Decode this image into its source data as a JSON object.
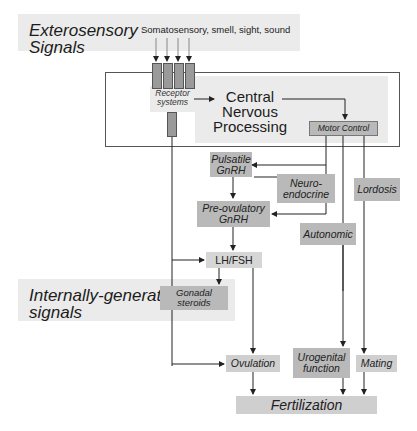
{
  "exterosensory": {
    "title_line1": "Exterosensory",
    "title_line2": "Signals",
    "inputs_label": "Somatosensory, smell, sight, sound"
  },
  "cns": {
    "receptor_line1": "Receptor",
    "receptor_line2": "systems",
    "processing_line1": "Central",
    "processing_line2": "Nervous",
    "processing_line3": "Processing",
    "motor_control": "Motor Control"
  },
  "nodes": {
    "pulsatile_line1": "Pulsatile",
    "pulsatile_line2": "GnRH",
    "neuro_line1": "Neuro-",
    "neuro_line2": "endocrine",
    "lordosis": "Lordosis",
    "preovulatory_line1": "Pre-ovulatory",
    "preovulatory_line2": "GnRH",
    "autonomic": "Autonomic",
    "lhfsh": "LH/FSH",
    "gonadal_line1": "Gonadal",
    "gonadal_line2": "steroids",
    "ovulation": "Ovulation",
    "urogenital_line1": "Urogenital",
    "urogenital_line2": "function",
    "mating": "Mating",
    "fertilization": "Fertilization"
  },
  "internal": {
    "title_line1": "Internally-generated",
    "title_line2": "signals"
  },
  "colors": {
    "panel_bg": "#ebebeb",
    "box_bg": "#b9b9b9",
    "line": "#222222"
  }
}
